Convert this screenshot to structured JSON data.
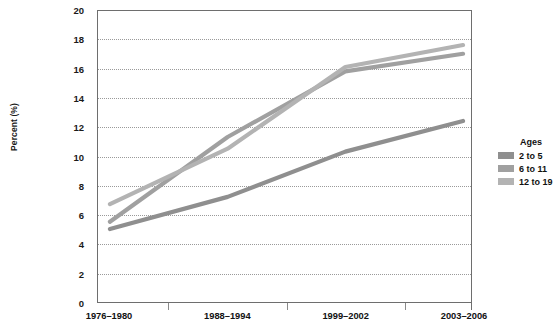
{
  "chart_data": {
    "type": "line",
    "title": "",
    "xlabel": "",
    "ylabel": "Percent (%)",
    "ylim": [
      0,
      20
    ],
    "ytick_step": 2,
    "yticks": [
      20,
      18,
      16,
      14,
      12,
      10,
      8,
      6,
      4,
      2,
      0
    ],
    "grid": true,
    "grid_style": "dotted-horizontal",
    "legend_position": "right",
    "legend_title": "Ages",
    "categories": [
      "1976–1980",
      "1988–1994",
      "1999–2002",
      "2003–2006"
    ],
    "series": [
      {
        "name": "2 to 5",
        "color": "#8f8f8f",
        "values": [
          5.0,
          7.2,
          10.3,
          12.4
        ]
      },
      {
        "name": "6 to 11",
        "color": "#a0a0a0",
        "values": [
          5.5,
          11.3,
          15.8,
          17.0
        ]
      },
      {
        "name": "12 to 19",
        "color": "#b3b3b3",
        "values": [
          6.7,
          10.5,
          16.1,
          17.6
        ]
      }
    ]
  },
  "axes": {
    "y_title": "Percent (%)",
    "axis_color": "#6e6e6e",
    "grid_color": "#9a9a9a",
    "tick_color": "#8a8a8a"
  },
  "legend": {
    "title": "Ages",
    "items": [
      {
        "label": "2 to 5",
        "color": "#8f8f8f"
      },
      {
        "label": "6 to 11",
        "color": "#a0a0a0"
      },
      {
        "label": "12 to 19",
        "color": "#b3b3b3"
      }
    ]
  }
}
